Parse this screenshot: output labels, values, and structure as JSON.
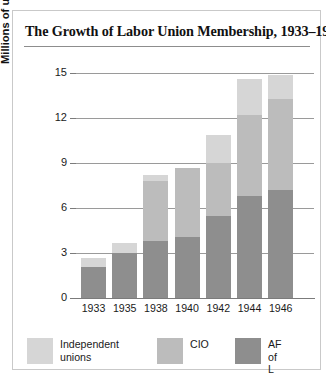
{
  "figure": {
    "title": "The Growth of Labor Union Membership, 1933–1946"
  },
  "axes": {
    "y_title": "Millions of union members",
    "y_ticks": [
      "0",
      "3",
      "6",
      "9",
      "12",
      "15"
    ],
    "x_ticks": [
      "1933",
      "1935",
      "1938",
      "1940",
      "1942",
      "1944",
      "1946"
    ]
  },
  "legend": {
    "items": [
      {
        "label": "Independent\nunions",
        "color": "#d6d6d6",
        "key": "independent-unions"
      },
      {
        "label": "CIO",
        "color": "#bcbcbc",
        "key": "cio"
      },
      {
        "label": "AF of L",
        "color": "#8e8e8e",
        "key": "af-of-l"
      }
    ]
  },
  "chart_data": {
    "type": "bar",
    "subtype": "stacked-vertical-bar",
    "title": "The Growth of Labor Union Membership, 1933–1946",
    "xlabel": "",
    "ylabel": "Millions of union members",
    "ylim": [
      0,
      15
    ],
    "yticks": [
      0,
      3,
      6,
      9,
      12,
      15
    ],
    "grid": "horizontal",
    "legend_position": "bottom",
    "categories": [
      "1933",
      "1935",
      "1938",
      "1940",
      "1942",
      "1944",
      "1946"
    ],
    "series": [
      {
        "name": "AF of L",
        "color": "#8e8e8e",
        "values": [
          2.1,
          3.0,
          3.8,
          4.1,
          5.5,
          6.8,
          7.2
        ]
      },
      {
        "name": "CIO",
        "color": "#bcbcbc",
        "values": [
          0.0,
          0.0,
          4.0,
          4.6,
          3.5,
          5.4,
          6.1
        ]
      },
      {
        "name": "Independent unions",
        "color": "#d6d6d6",
        "values": [
          0.6,
          0.7,
          0.4,
          0.0,
          1.9,
          2.4,
          1.6
        ]
      }
    ],
    "totals": [
      2.7,
      3.7,
      8.2,
      8.7,
      10.9,
      14.6,
      14.9
    ]
  }
}
